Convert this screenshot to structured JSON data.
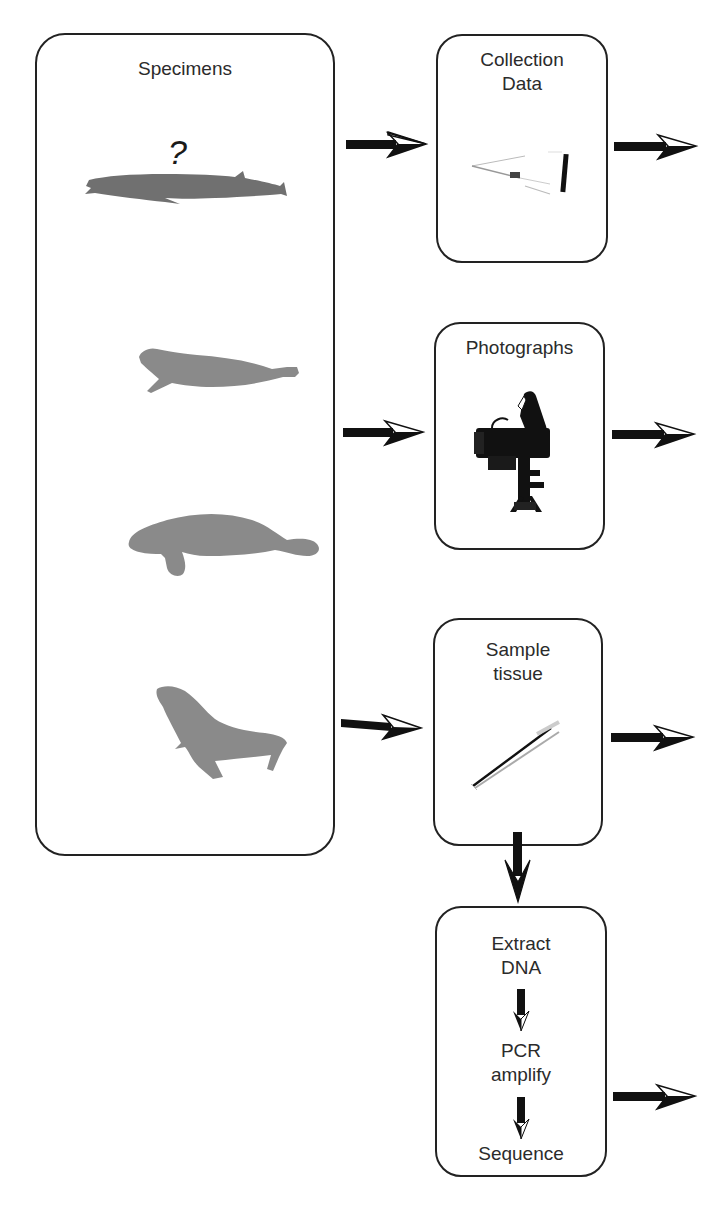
{
  "diagram": {
    "specimens_box": {
      "title": "Specimens",
      "unknown_marker": "?",
      "animals": [
        {
          "name": "beaked-whale",
          "color": "#707070"
        },
        {
          "name": "seal",
          "color": "#8a8a8a"
        },
        {
          "name": "manatee",
          "color": "#8a8a8a"
        },
        {
          "name": "sea-lion",
          "color": "#8a8a8a"
        }
      ]
    },
    "collection_box": {
      "title": "Collection\nData",
      "icon": "collection-tools-icon"
    },
    "photographs_box": {
      "title": "Photographs",
      "icon": "camera-on-tripod-icon"
    },
    "sample_box": {
      "title": "Sample\ntissue",
      "icon": "forceps-icon"
    },
    "dna_box": {
      "steps": [
        "Extract\nDNA",
        "PCR\namplify",
        "Sequence"
      ]
    },
    "colors": {
      "border": "#222222",
      "arrow": "#111111",
      "text": "#2b2b2b",
      "silhouette": "#8a8a8a",
      "background": "#ffffff"
    }
  }
}
